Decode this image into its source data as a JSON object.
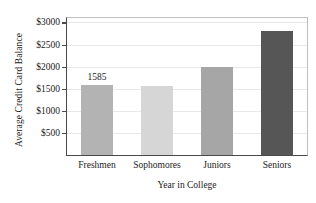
{
  "chart_data": {
    "type": "bar",
    "title": "",
    "xlabel": "Year in College",
    "ylabel": "Average Credit Card Balance",
    "categories": [
      "Freshmen",
      "Sophomores",
      "Juniors",
      "Seniors"
    ],
    "values": [
      1585,
      1560,
      2000,
      2800
    ],
    "data_labels": [
      "1585",
      "",
      "",
      ""
    ],
    "bar_colors": [
      "#b3b3b3",
      "#d6d6d6",
      "#a6a6a6",
      "#565656"
    ],
    "ylim": [
      0,
      3100
    ],
    "yticks": [
      500,
      1000,
      1500,
      2000,
      2500,
      3000
    ],
    "ytick_labels": [
      "$500",
      "$1000",
      "$1500",
      "$2000",
      "$2500",
      "$3000"
    ],
    "grid": true,
    "grid_axis": "y",
    "legend": "none",
    "frame_color": "#4a4a4a",
    "gridline_color": "#e8e8e8",
    "background": "#ffffff"
  }
}
